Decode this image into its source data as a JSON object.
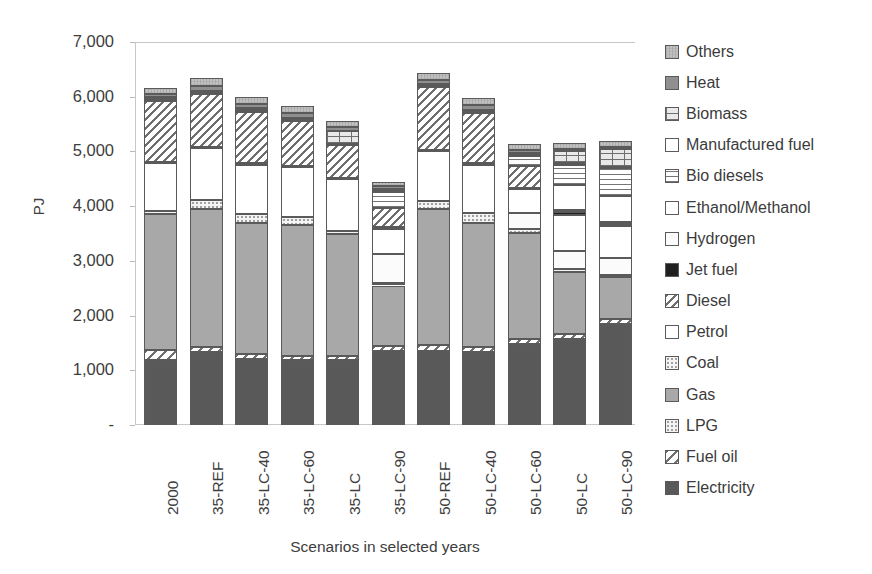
{
  "chart_data": {
    "type": "bar",
    "subtype": "stacked-bar",
    "title": "",
    "xlabel": "Scenarios in selected years",
    "ylabel": "PJ",
    "ylim": [
      0,
      7000
    ],
    "ytick_values": [
      0,
      1000,
      2000,
      3000,
      4000,
      5000,
      6000,
      7000
    ],
    "ytick_labels": [
      "-",
      "1,000",
      "2,000",
      "3,000",
      "4,000",
      "5,000",
      "6,000",
      "7,000"
    ],
    "grid": false,
    "legend_position": "right",
    "categories": [
      "2000",
      "35-REF",
      "35-LC-40",
      "35-LC-60",
      "35-LC",
      "35-LC-90",
      "50-REF",
      "50-LC-40",
      "50-LC-60",
      "50-LC",
      "50-LC-90"
    ],
    "series": [
      {
        "name": "Electricity",
        "pattern": "solid-dark",
        "color": "#595959",
        "values": [
          1180,
          1330,
          1200,
          1180,
          1180,
          1350,
          1350,
          1330,
          1480,
          1580,
          1840
        ]
      },
      {
        "name": "Fuel oil",
        "pattern": "diagonal-hatch-light",
        "color": "#ffffff",
        "values": [
          200,
          100,
          100,
          90,
          90,
          100,
          110,
          100,
          90,
          90,
          100
        ]
      },
      {
        "name": "Gas",
        "pattern": "solid-mid",
        "color": "#a6a6a6",
        "values": [
          2470,
          2520,
          2390,
          2390,
          2230,
          1100,
          2490,
          2260,
          1940,
          1130,
          760
        ]
      },
      {
        "name": "LPG",
        "pattern": "dotted-light",
        "color": "#f2f2f2",
        "values": [
          60,
          160,
          170,
          140,
          50,
          40,
          150,
          180,
          70,
          50,
          50
        ]
      },
      {
        "name": "Hydrogen",
        "pattern": "very-light",
        "color": "#fafafa",
        "values": [
          0,
          0,
          0,
          0,
          0,
          530,
          0,
          0,
          300,
          330,
          300
        ]
      },
      {
        "name": "Ethanol/Methanol",
        "pattern": "white",
        "color": "#ffffff",
        "values": [
          870,
          960,
          900,
          910,
          940,
          460,
          900,
          890,
          430,
          660,
          580
        ]
      },
      {
        "name": "Jet fuel",
        "pattern": "solid-black",
        "color": "#1a1a1a",
        "values": [
          20,
          20,
          20,
          20,
          20,
          30,
          20,
          20,
          20,
          50,
          40
        ]
      },
      {
        "name": "Diesel",
        "pattern": "diagonal-hatch",
        "color": "#d9d9d9",
        "values": [
          1130,
          960,
          950,
          830,
          600,
          360,
          1160,
          920,
          410,
          40,
          40
        ]
      },
      {
        "name": "Petrol",
        "pattern": "white-plain",
        "color": "#ffffff",
        "values": [
          0,
          0,
          0,
          0,
          0,
          0,
          0,
          0,
          0,
          450,
          470
        ]
      },
      {
        "name": "Bio diesels",
        "pattern": "horizontal-lines",
        "color": "#ededed",
        "values": [
          0,
          0,
          0,
          0,
          0,
          280,
          0,
          0,
          170,
          380,
          520
        ]
      },
      {
        "name": "Manufactured fuel",
        "pattern": "white-plain2",
        "color": "#ffffff",
        "values": [
          20,
          20,
          20,
          20,
          20,
          20,
          20,
          20,
          20,
          20,
          20
        ]
      },
      {
        "name": "Biomass",
        "pattern": "brick",
        "color": "#e6e6e6",
        "values": [
          40,
          40,
          40,
          40,
          250,
          50,
          40,
          40,
          40,
          230,
          330
        ]
      },
      {
        "name": "Heat",
        "pattern": "solid-mid-dark",
        "color": "#8c8c8c",
        "values": [
          60,
          90,
          80,
          90,
          60,
          40,
          70,
          80,
          50,
          30,
          30
        ]
      },
      {
        "name": "Others",
        "pattern": "noise-grey",
        "color": "#bfbfbf",
        "values": [
          110,
          140,
          120,
          120,
          120,
          90,
          130,
          130,
          120,
          110,
          120
        ]
      }
    ]
  },
  "axes": {
    "y_title": "PJ",
    "x_title": "Scenarios in selected years"
  },
  "legend": {
    "items": [
      {
        "label": "Others"
      },
      {
        "label": "Heat"
      },
      {
        "label": "Biomass"
      },
      {
        "label": "Manufactured fuel"
      },
      {
        "label": "Bio diesels"
      },
      {
        "label": "Ethanol/Methanol"
      },
      {
        "label": "Hydrogen"
      },
      {
        "label": "Jet fuel"
      },
      {
        "label": "Diesel"
      },
      {
        "label": "Petrol"
      },
      {
        "label": "Coal"
      },
      {
        "label": "Gas"
      },
      {
        "label": "LPG"
      },
      {
        "label": "Fuel oil"
      },
      {
        "label": "Electricity"
      }
    ]
  }
}
